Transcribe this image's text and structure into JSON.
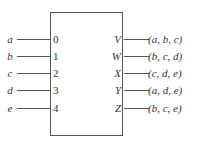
{
  "diagram": {
    "inputs": [
      {
        "signal": "a",
        "port": "0"
      },
      {
        "signal": "b",
        "port": "1"
      },
      {
        "signal": "c",
        "port": "2"
      },
      {
        "signal": "d",
        "port": "3"
      },
      {
        "signal": "e",
        "port": "4"
      }
    ],
    "outputs": [
      {
        "port": "V",
        "value": "(a, b, c)"
      },
      {
        "port": "W",
        "value": "(b, c, d)"
      },
      {
        "port": "X",
        "value": "(c, d, e)"
      },
      {
        "port": "Y",
        "value": "(a, d, e)"
      },
      {
        "port": "Z",
        "value": "(b, c, e)"
      }
    ]
  }
}
